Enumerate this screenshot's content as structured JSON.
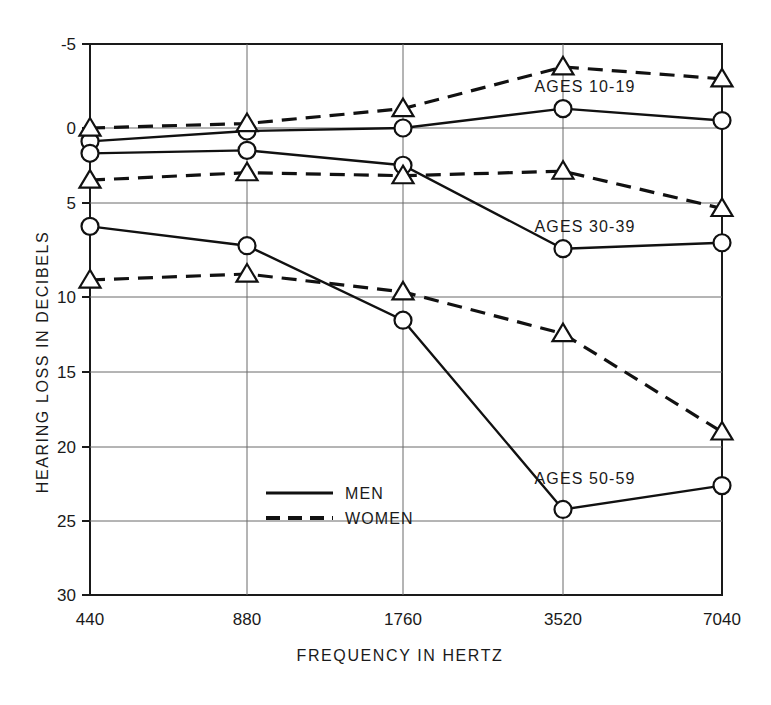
{
  "chart_data": {
    "type": "line",
    "title": "",
    "xlabel": "FREQUENCY IN HERTZ",
    "ylabel": "HEARING LOSS IN DECIBELS",
    "x": [
      440,
      880,
      1760,
      3520,
      7040
    ],
    "xtick_labels": [
      "440",
      "880",
      "1760",
      "3520",
      "7040"
    ],
    "xscale": "categorical-octave",
    "ytick_labels": [
      "-5",
      "0",
      "5",
      "10",
      "15",
      "20",
      "25",
      "30"
    ],
    "yticks": [
      -5,
      0,
      5,
      10,
      15,
      20,
      25,
      30
    ],
    "ylim": [
      -5,
      30
    ],
    "y_inverted": true,
    "grid": true,
    "legend_position": "inside-lower-left",
    "series": [
      {
        "name": "AGES 10-19 MEN",
        "group": "AGES 10-19",
        "sex": "MEN",
        "style": "solid",
        "marker": "circle",
        "values": [
          0.9,
          0.2,
          0.0,
          -1.3,
          -0.5
        ]
      },
      {
        "name": "AGES 10-19 WOMEN",
        "group": "AGES 10-19",
        "sex": "WOMEN",
        "style": "dashed",
        "marker": "triangle",
        "values": [
          0.0,
          -0.3,
          -1.3,
          -4.1,
          -3.3
        ]
      },
      {
        "name": "AGES 30-39 MEN",
        "group": "AGES 30-39",
        "sex": "MEN",
        "style": "solid",
        "marker": "circle",
        "values": [
          1.7,
          1.5,
          2.5,
          8.1,
          7.7
        ]
      },
      {
        "name": "AGES 30-39 WOMEN",
        "group": "AGES 30-39",
        "sex": "WOMEN",
        "style": "dashed",
        "marker": "triangle",
        "values": [
          3.5,
          3.0,
          3.2,
          2.9,
          5.4
        ]
      },
      {
        "name": "AGES 50-59 MEN",
        "group": "AGES 50-59",
        "sex": "MEN",
        "style": "solid",
        "marker": "circle",
        "values": [
          6.6,
          7.9,
          12.9,
          25.6,
          24.0
        ]
      },
      {
        "name": "AGES 50-59 WOMEN",
        "group": "AGES 50-59",
        "sex": "WOMEN",
        "style": "dashed",
        "marker": "triangle",
        "values": [
          10.2,
          9.8,
          11.0,
          13.8,
          20.4
        ]
      }
    ],
    "annotations": [
      {
        "text": "AGES 10-19",
        "x_px": 585,
        "y_px": 92
      },
      {
        "text": "AGES 30-39",
        "x_px": 585,
        "y_px": 232
      },
      {
        "text": "AGES 50-59",
        "x_px": 585,
        "y_px": 484
      }
    ],
    "legend": [
      {
        "label": "MEN",
        "style": "solid"
      },
      {
        "label": "WOMEN",
        "style": "dashed"
      }
    ]
  }
}
